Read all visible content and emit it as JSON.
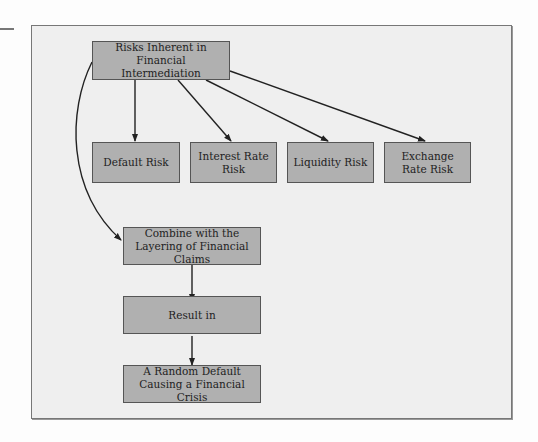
{
  "diagram": {
    "root": "Risks Inherent in Financial Intermediation",
    "root_lines": [
      "Risks Inherent in Financial",
      "Intermediation"
    ],
    "risks": [
      {
        "label": "Default Risk"
      },
      {
        "label": "Interest Rate Risk"
      },
      {
        "label": "Liquidity Risk"
      },
      {
        "label": "Exchange Rate Risk"
      }
    ],
    "chain": [
      {
        "label": "Combine with the Layering of Financial Claims"
      },
      {
        "label": "Result in"
      },
      {
        "label": "A Random Default Causing a Financial Crisis"
      }
    ],
    "colors": {
      "box_fill": "#b0b0b0",
      "frame_bg": "#efefef",
      "line": "#222222"
    }
  }
}
